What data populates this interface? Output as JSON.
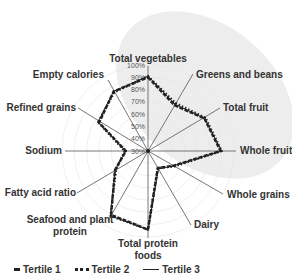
{
  "chart_data": {
    "type": "radar",
    "title": "",
    "categories": [
      "Total vegetables",
      "Greens and beans",
      "Total fruit",
      "Whole fruit",
      "Whole grains",
      "Dairy",
      "Total protein foods",
      "Seafood and plant protein",
      "Fatty acid ratio",
      "Sodium",
      "Refined grains",
      "Empty calories"
    ],
    "axis_range": [
      30,
      100
    ],
    "axis_unit": "%",
    "ticks": [
      "30%",
      "40%",
      "50%",
      "60%",
      "70%",
      "80%",
      "90%",
      "100%"
    ],
    "series": [
      {
        "name": "Tertile 1",
        "style": "dashed-thick",
        "values": [
          90,
          73,
          83,
          89,
          54,
          46,
          94,
          90,
          61,
          48,
          76,
          86
        ]
      },
      {
        "name": "Tertile 2",
        "style": "dotted",
        "values": [
          91,
          75,
          84,
          90,
          55,
          46,
          94,
          91,
          60,
          49,
          77,
          85
        ]
      },
      {
        "name": "Tertile 3",
        "style": "solid-thin",
        "values": [
          91,
          74,
          83,
          90,
          54,
          47,
          94,
          91,
          61,
          48,
          77,
          86
        ]
      }
    ],
    "legend": {
      "position": "bottom-left",
      "entries": [
        "Tertile 1",
        "Tertile 2",
        "Tertile 3"
      ]
    },
    "grid": true
  },
  "colors": {
    "series": "#222222",
    "axes": "#555555",
    "background_shade": "#ededed"
  }
}
